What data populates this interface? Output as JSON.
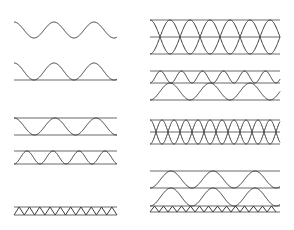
{
  "diagram": {
    "subject": "Corrugated board cross-section profiles",
    "colors": {
      "background": "#ffffff",
      "liner": "#6b6b6b",
      "flute": "#3d3d3d"
    },
    "left_column": [
      {
        "id": "fluting-only",
        "liners_y": [],
        "flutes": [
          {
            "type": "sine",
            "x0": 14,
            "x1": 117,
            "y_top": 22,
            "y_bottom": 38,
            "period": 40,
            "phase": 0
          }
        ]
      },
      {
        "id": "single-face",
        "liners_y": [
          80
        ],
        "flutes": [
          {
            "type": "sine",
            "x0": 14,
            "x1": 117,
            "y_top": 63,
            "y_bottom": 80,
            "period": 40,
            "phase": 0
          }
        ]
      },
      {
        "id": "single-wall",
        "liners_y": [
          118,
          135
        ],
        "flutes": [
          {
            "type": "sine",
            "x0": 14,
            "x1": 117,
            "y_top": 118,
            "y_bottom": 135,
            "period": 41,
            "phase": 0
          }
        ]
      },
      {
        "id": "single-wall-small-flute",
        "liners_y": [
          151,
          164
        ],
        "flutes": [
          {
            "type": "sine",
            "x0": 14,
            "x1": 117,
            "y_top": 151,
            "y_bottom": 164,
            "period": 26,
            "phase": 0.5
          }
        ]
      },
      {
        "id": "micro-flute",
        "liners_y": [
          207,
          215
        ],
        "flutes": [
          {
            "type": "triangle",
            "x0": 14,
            "x1": 117,
            "y_top": 207,
            "y_bottom": 215,
            "period": 10.3,
            "phase": 0
          }
        ]
      }
    ],
    "right_column": [
      {
        "id": "double-wave-crossing",
        "liners_y": [
          20,
          37,
          54
        ],
        "flutes": [
          {
            "type": "sine",
            "x0": 150,
            "x1": 280,
            "y_top": 20,
            "y_bottom": 54,
            "period": 40,
            "phase": 0.5
          },
          {
            "type": "sine",
            "x0": 150,
            "x1": 280,
            "y_top": 20,
            "y_bottom": 54,
            "period": 40,
            "phase": 0
          }
        ]
      },
      {
        "id": "double-wall",
        "liners_y": [
          71,
          83,
          100
        ],
        "flutes": [
          {
            "type": "sine",
            "x0": 150,
            "x1": 280,
            "y_top": 71,
            "y_bottom": 83,
            "period": 21,
            "phase": 0.5
          },
          {
            "type": "sine",
            "x0": 150,
            "x1": 280,
            "y_top": 83,
            "y_bottom": 100,
            "period": 40,
            "phase": 0.5
          }
        ]
      },
      {
        "id": "double-wall-crossing",
        "liners_y": [
          120,
          132,
          144
        ],
        "flutes": [
          {
            "type": "sine",
            "x0": 150,
            "x1": 280,
            "y_top": 120,
            "y_bottom": 144,
            "period": 24,
            "phase": 0.5
          },
          {
            "type": "sine",
            "x0": 150,
            "x1": 280,
            "y_top": 120,
            "y_bottom": 144,
            "period": 24,
            "phase": 0
          }
        ]
      },
      {
        "id": "triple-wall",
        "liners_y": [
          171,
          188,
          206,
          212
        ],
        "flutes": [
          {
            "type": "sine",
            "x0": 150,
            "x1": 280,
            "y_top": 171,
            "y_bottom": 188,
            "period": 42,
            "phase": 0.5
          },
          {
            "type": "sine",
            "x0": 150,
            "x1": 280,
            "y_top": 188,
            "y_bottom": 206,
            "period": 42,
            "phase": 0.5
          },
          {
            "type": "triangle",
            "x0": 150,
            "x1": 280,
            "y_top": 206,
            "y_bottom": 212,
            "period": 9,
            "phase": 0
          }
        ]
      }
    ]
  }
}
